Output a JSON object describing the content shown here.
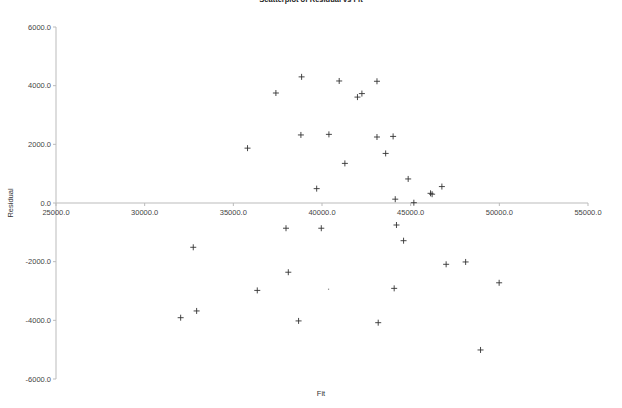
{
  "chart_data": {
    "type": "scatter",
    "title": "Scatterplot of Residual vs Fit",
    "xlabel": "Fit",
    "ylabel": "Residual",
    "xlim": [
      25000,
      55000
    ],
    "ylim": [
      -6000,
      6000
    ],
    "x_ticks": [
      "25000.0",
      "30000.0",
      "35000.0",
      "40000.0",
      "45000.0",
      "50000.0",
      "55000.0"
    ],
    "y_ticks": [
      "6000.0",
      "4000.0",
      "2000.0",
      "0.0",
      "-2000.0",
      "-4000.0",
      "-6000.0"
    ],
    "grid": false,
    "legend": null,
    "marker": "+",
    "marker_color": "#333333",
    "axis_color": "#bbbbbb",
    "series": [
      {
        "name": "Residual",
        "points": [
          {
            "x": 35800,
            "y": 1870
          },
          {
            "x": 37400,
            "y": 3750
          },
          {
            "x": 38850,
            "y": 4300
          },
          {
            "x": 40970,
            "y": 4160
          },
          {
            "x": 43100,
            "y": 4150
          },
          {
            "x": 42000,
            "y": 3610
          },
          {
            "x": 42250,
            "y": 3730
          },
          {
            "x": 38810,
            "y": 2320
          },
          {
            "x": 40390,
            "y": 2340
          },
          {
            "x": 43100,
            "y": 2250
          },
          {
            "x": 44010,
            "y": 2270
          },
          {
            "x": 43590,
            "y": 1690
          },
          {
            "x": 41290,
            "y": 1350
          },
          {
            "x": 39700,
            "y": 490
          },
          {
            "x": 44130,
            "y": 130
          },
          {
            "x": 44860,
            "y": 820
          },
          {
            "x": 45180,
            "y": 10
          },
          {
            "x": 46120,
            "y": 330
          },
          {
            "x": 46210,
            "y": 300
          },
          {
            "x": 46760,
            "y": 560
          },
          {
            "x": 44200,
            "y": -750
          },
          {
            "x": 44600,
            "y": -1285
          },
          {
            "x": 47000,
            "y": -2090
          },
          {
            "x": 48100,
            "y": -2010
          },
          {
            "x": 49990,
            "y": -2720
          },
          {
            "x": 48940,
            "y": -5010
          },
          {
            "x": 37970,
            "y": -860
          },
          {
            "x": 39960,
            "y": -860
          },
          {
            "x": 32740,
            "y": -1510
          },
          {
            "x": 38100,
            "y": -2360
          },
          {
            "x": 36350,
            "y": -2980
          },
          {
            "x": 40370,
            "y": -2940,
            "faint": true
          },
          {
            "x": 44070,
            "y": -2910
          },
          {
            "x": 32030,
            "y": -3910
          },
          {
            "x": 32930,
            "y": -3680
          },
          {
            "x": 38680,
            "y": -4020
          },
          {
            "x": 43170,
            "y": -4080
          }
        ]
      }
    ]
  }
}
